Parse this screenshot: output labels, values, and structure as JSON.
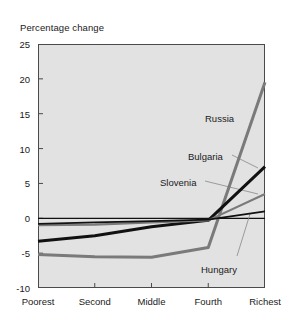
{
  "chart_data": {
    "type": "line",
    "title": "Percentage change",
    "xlabel": "",
    "ylabel": "",
    "categories": [
      "Poorest",
      "Second",
      "Middle",
      "Fourth",
      "Richest"
    ],
    "ylim": [
      -10,
      25
    ],
    "yticks": [
      25,
      20,
      15,
      10,
      5,
      0,
      -5,
      -10
    ],
    "ytick_labels": [
      "25",
      "20",
      "15",
      "10",
      "5",
      "0",
      "-5",
      "-10"
    ],
    "grid": false,
    "legend": "inline-annotations",
    "zero_line": true,
    "series": [
      {
        "name": "Russia",
        "color": "#7a7a7a",
        "width": 3.0,
        "values": [
          -5.2,
          -5.5,
          -5.6,
          -4.2,
          19.5
        ],
        "label_x": 205,
        "label_y": 113,
        "leader": false
      },
      {
        "name": "Bulgaria",
        "color": "#111111",
        "width": 3.0,
        "values": [
          -3.3,
          -2.5,
          -1.2,
          -0.3,
          7.4
        ],
        "label_x": 188,
        "label_y": 151,
        "leader": true,
        "leader_from": [
          232,
          155
        ],
        "leader_to": [
          258,
          168
        ]
      },
      {
        "name": "Slovenia",
        "color": "#7a7a7a",
        "width": 2.2,
        "values": [
          -1.0,
          -0.9,
          -0.6,
          -0.3,
          3.5
        ],
        "label_x": 160,
        "label_y": 177,
        "leader": true,
        "leader_from": [
          205,
          181
        ],
        "leader_to": [
          258,
          194
        ]
      },
      {
        "name": "Hungary",
        "color": "#111111",
        "width": 1.8,
        "values": [
          -0.8,
          -0.6,
          -0.4,
          -0.2,
          1.0
        ],
        "label_x": 201,
        "label_y": 264,
        "leader": true,
        "leader_from": [
          237,
          256
        ],
        "leader_to": [
          250,
          214
        ]
      }
    ],
    "colors": {
      "plot_background": "#e2e2e2",
      "page_background": "#ffffff",
      "axis": "#4a4a4a",
      "text": "#1a1a1a",
      "gray_series": "#7a7a7a",
      "black_series": "#111111"
    }
  }
}
